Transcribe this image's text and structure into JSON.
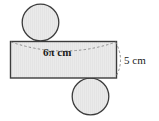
{
  "figure": {
    "background_color": "#ffffff",
    "shape_fill": "#e9e9e9",
    "shape_stroke": "#3c3c3c",
    "dashed_stroke": "#8a8a8a",
    "text_color": "#1a1a1a",
    "labels": {
      "circumference": "6π cm",
      "height": "5 cm"
    },
    "parts": [
      {
        "name": "top-circle",
        "type": "circle",
        "cx": 40.5,
        "cy": 22.5,
        "r": 18.5
      },
      {
        "name": "lateral-rectangle",
        "type": "rect",
        "x": 10,
        "y": 41,
        "width": 107,
        "height": 37
      },
      {
        "name": "bottom-circle",
        "type": "circle",
        "cx": 90.5,
        "cy": 96.5,
        "r": 18.5
      },
      {
        "name": "top-dashed-arc",
        "type": "arc",
        "from_x": 10,
        "from_y": 42,
        "to_x": 117,
        "to_y": 42,
        "sag": 9
      },
      {
        "name": "right-dashed-arc",
        "type": "arc",
        "from_x": 116,
        "from_y": 41,
        "to_x": 116,
        "to_y": 78,
        "bulge": 9
      }
    ]
  }
}
